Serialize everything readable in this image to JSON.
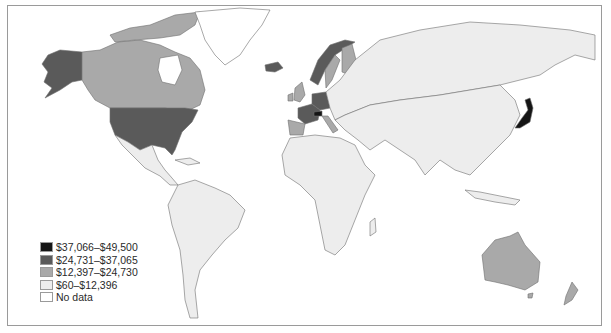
{
  "map": {
    "type": "choropleth",
    "subject": "GDP per capita by country",
    "legend": [
      {
        "label": "$37,066–$49,500",
        "color": "#151515"
      },
      {
        "label": "$24,731–$37,065",
        "color": "#5a5a5a"
      },
      {
        "label": "$12,397–$24,730",
        "color": "#a9a9a9"
      },
      {
        "label": "$60–$12,396",
        "color": "#ededed"
      },
      {
        "label": "No data",
        "color": "#ffffff"
      }
    ],
    "highlighted_regions": {
      "$37,066–$49,500": [
        "Japan",
        "Switzerland"
      ],
      "$24,731–$37,065": [
        "United States",
        "Alaska",
        "Norway",
        "Iceland",
        "France",
        "Germany",
        "Benelux",
        "Denmark",
        "Austria",
        "Australia"
      ],
      "$12,397–$24,730": [
        "Canada",
        "Greenland (part)",
        "Sweden",
        "Finland",
        "United Kingdom",
        "Ireland",
        "Spain",
        "Italy",
        "New Zealand"
      ],
      "$60–$12,396": [
        "Latin America",
        "Africa",
        "Russia",
        "Asia",
        "Eastern Europe",
        "Middle East"
      ]
    }
  }
}
